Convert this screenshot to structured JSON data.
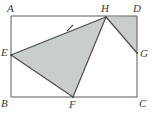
{
  "figure": {
    "kind": "geometry-diagram",
    "colors": {
      "background": "#ffffff",
      "stroke": "#555555",
      "shaded_fill": "#c9cdcd",
      "label_color": "#3a3a3a"
    },
    "rectangle": {
      "name": "ABCD",
      "corners": {
        "A": {
          "x": 11,
          "y": 16
        },
        "D": {
          "x": 137,
          "y": 16
        },
        "C": {
          "x": 137,
          "y": 97
        },
        "B": {
          "x": 11,
          "y": 97
        }
      }
    },
    "points": [
      {
        "id": "A",
        "label": "A",
        "x": 11,
        "y": 16,
        "label_x": 7,
        "label_y": 3,
        "on": "corner-top-left"
      },
      {
        "id": "H",
        "label": "H",
        "x": 106,
        "y": 17,
        "label_x": 101,
        "label_y": 3,
        "on": "side-AD"
      },
      {
        "id": "D",
        "label": "D",
        "x": 137,
        "y": 16,
        "label_x": 133,
        "label_y": 3,
        "on": "corner-top-right"
      },
      {
        "id": "E",
        "label": "E",
        "x": 11,
        "y": 55,
        "label_x": 1,
        "label_y": 47,
        "on": "side-AB"
      },
      {
        "id": "G",
        "label": "G",
        "x": 137,
        "y": 53,
        "label_x": 140,
        "label_y": 48,
        "on": "side-DC"
      },
      {
        "id": "B",
        "label": "B",
        "x": 11,
        "y": 97,
        "label_x": 1,
        "label_y": 98,
        "on": "corner-bottom-left"
      },
      {
        "id": "F",
        "label": "F",
        "x": 73,
        "y": 97,
        "label_x": 69,
        "label_y": 99,
        "on": "side-BC"
      },
      {
        "id": "C",
        "label": "C",
        "x": 137,
        "y": 97,
        "label_x": 139,
        "label_y": 98,
        "on": "corner-bottom-right"
      }
    ],
    "shaded_regions": [
      {
        "id": "triangle-EHF",
        "label": "EHF",
        "polygon": "11,55 106,17 73,97"
      },
      {
        "id": "triangle-HDG",
        "label": "HDG",
        "polygon": "106,17 137,16 137,53"
      }
    ],
    "segments": [
      {
        "id": "segment-EH",
        "from": "E",
        "to": "H",
        "tick_marks": 1
      },
      {
        "id": "segment-HF",
        "from": "H",
        "to": "F",
        "tick_marks": 0
      },
      {
        "id": "segment-FE",
        "from": "F",
        "to": "E",
        "tick_marks": 0
      },
      {
        "id": "segment-HG",
        "from": "H",
        "to": "G",
        "tick_marks": 0
      }
    ],
    "tick_mark": {
      "on_segment": "segment-EH",
      "x": 70,
      "y": 28
    }
  }
}
